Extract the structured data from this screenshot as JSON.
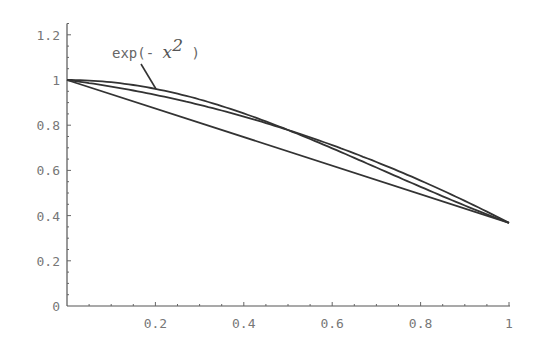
{
  "chart_data": {
    "type": "line",
    "title": "",
    "xlabel": "",
    "ylabel": "",
    "xlim": [
      0,
      1
    ],
    "ylim": [
      0,
      1.25
    ],
    "grid": false,
    "x_ticks": [
      "0.2",
      "0.4",
      "0.6",
      "0.8",
      "1"
    ],
    "y_ticks": [
      "0",
      "0.2",
      "0.4",
      "0.6",
      "0.8",
      "1",
      "1.2"
    ],
    "annotations": [
      {
        "text": "exp(- x^2 )",
        "points_to_series": "exp(-x^2)",
        "at_x": 0.2
      }
    ],
    "series": [
      {
        "name": "exp(-x^2)",
        "x": [
          0,
          0.1,
          0.2,
          0.3,
          0.4,
          0.5,
          0.6,
          0.7,
          0.8,
          0.9,
          1.0
        ],
        "values": [
          1.0,
          0.99,
          0.961,
          0.914,
          0.852,
          0.779,
          0.698,
          0.613,
          0.527,
          0.445,
          0.368
        ]
      },
      {
        "name": "quadratic interpolant",
        "x": [
          0,
          0.1,
          0.2,
          0.3,
          0.4,
          0.5,
          0.6,
          0.7,
          0.8,
          0.9,
          1.0
        ],
        "values": [
          1.0,
          0.964,
          0.922,
          0.874,
          0.819,
          0.779,
          0.69,
          0.615,
          0.534,
          0.448,
          0.368
        ]
      },
      {
        "name": "linear interpolant",
        "x": [
          0,
          1
        ],
        "values": [
          1.0,
          0.368
        ]
      }
    ]
  },
  "labels": {
    "annotation_prefix": "exp(- ",
    "annotation_var": "x",
    "annotation_exp": "2",
    "annotation_suffix": " )"
  }
}
